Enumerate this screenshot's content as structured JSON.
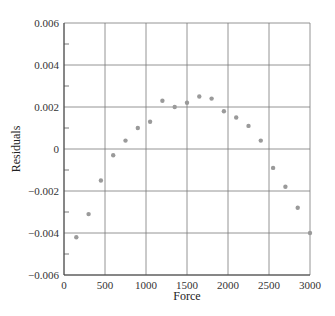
{
  "chart_data": {
    "type": "scatter",
    "title": "",
    "xlabel": "Force",
    "ylabel": "Residuals",
    "xlim": [
      0,
      3000
    ],
    "ylim": [
      -0.006,
      0.006
    ],
    "xticks": [
      "0",
      "500",
      "1000",
      "1500",
      "2000",
      "2500",
      "3000"
    ],
    "yticks": [
      "0.006",
      "0.004",
      "0.002",
      "0",
      "−0.002",
      "−0.004",
      "−0.006"
    ],
    "grid": true,
    "legend": null,
    "marker_color": "#9a9a9a",
    "x": [
      150,
      300,
      450,
      600,
      750,
      900,
      1050,
      1200,
      1350,
      1500,
      1650,
      1800,
      1950,
      2100,
      2250,
      2400,
      2550,
      2700,
      2850,
      3000
    ],
    "y": [
      -0.0042,
      -0.0031,
      -0.0015,
      -0.0003,
      0.0004,
      0.001,
      0.0013,
      0.0023,
      0.002,
      0.0022,
      0.0025,
      0.0024,
      0.0018,
      0.0015,
      0.0011,
      0.0004,
      -0.0009,
      -0.0018,
      -0.0028,
      -0.004
    ]
  }
}
